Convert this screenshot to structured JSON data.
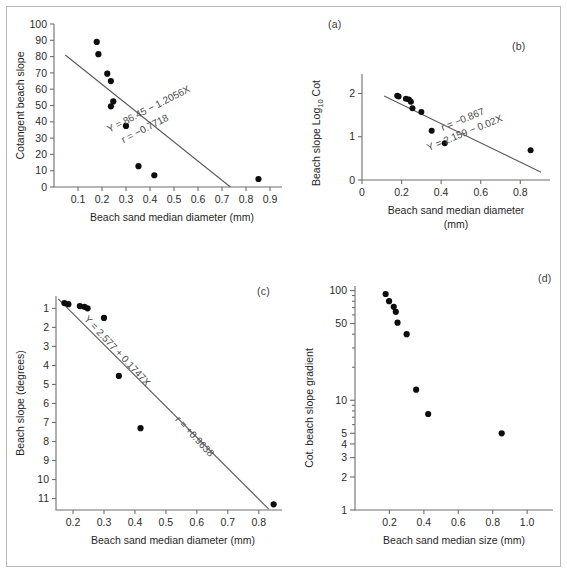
{
  "figure": {
    "background": "#ffffff",
    "border_color": "#b9b9b9",
    "point_color": "#0d0d0d",
    "line_color": "#5c5c5c"
  },
  "panels": {
    "a": {
      "label": "(a)"
    },
    "b": {
      "label": "(b)"
    },
    "c": {
      "label": "(c)"
    },
    "d": {
      "label": "(d)"
    }
  },
  "chart_data": [
    {
      "id": "a",
      "type": "scatter",
      "panel_label": "(a)",
      "title": "",
      "xlabel": "Beach sand median diameter (mm)",
      "ylabel": "Cotangent beach slope",
      "xlim": [
        0.0,
        0.95
      ],
      "ylim": [
        0,
        100
      ],
      "xticks": [
        0.1,
        0.2,
        0.3,
        0.4,
        0.5,
        0.6,
        0.7,
        0.8,
        0.9
      ],
      "xticklabels": [
        "0.1",
        "0.2",
        "0.3",
        "0.4",
        "0.5",
        "0.6",
        "0.7",
        "0.8",
        "0.9"
      ],
      "yticks": [
        0,
        10,
        20,
        30,
        40,
        50,
        60,
        70,
        80,
        90,
        100
      ],
      "yticklabels": [
        "0",
        "10",
        "20",
        "30",
        "40",
        "50",
        "60",
        "70",
        "80",
        "90",
        "100"
      ],
      "grid": false,
      "legend": "none",
      "x": [
        0.178,
        0.185,
        0.222,
        0.237,
        0.237,
        0.247,
        0.3,
        0.352,
        0.418,
        0.852
      ],
      "y": [
        89.0,
        81.5,
        69.5,
        65.0,
        49.5,
        52.5,
        37.5,
        12.8,
        7.2,
        4.9
      ],
      "fit": {
        "x0": 0.047,
        "y0": 81.0,
        "x1": 0.735,
        "y1": 0.0
      },
      "annotations": [
        {
          "text": "Y = 86.45 − 1.2056X",
          "x": 0.4,
          "y": 46.0,
          "rotate": -27
        },
        {
          "text": "r = −0.7718",
          "x": 0.385,
          "y": 34.0,
          "rotate": -27
        }
      ]
    },
    {
      "id": "b",
      "type": "scatter",
      "panel_label": "(b)",
      "title": "",
      "xlabel": "Beach sand median diameter (mm)",
      "xlabel_units": "(mm)",
      "ylabel": "Beach slope Log10 Cot",
      "ylabel_main": "Beach slope  Log",
      "ylabel_sub": "10",
      "ylabel_tail": " Cot",
      "xlim": [
        0.0,
        0.95
      ],
      "ylim": [
        0,
        2.45
      ],
      "xticks": [
        0.0,
        0.2,
        0.4,
        0.6,
        0.8
      ],
      "xticklabels": [
        "0",
        "0.2",
        "0.4",
        "0.6",
        "0.8"
      ],
      "yticks": [
        0,
        1,
        2
      ],
      "yticklabels": [
        "0",
        "1",
        "2"
      ],
      "grid": false,
      "legend": "none",
      "x": [
        0.178,
        0.185,
        0.222,
        0.237,
        0.247,
        0.255,
        0.3,
        0.352,
        0.418,
        0.852
      ],
      "y": [
        1.95,
        1.93,
        1.88,
        1.86,
        1.81,
        1.66,
        1.57,
        1.14,
        0.85,
        0.69
      ],
      "fit": {
        "x0": 0.112,
        "y0": 1.94,
        "x1": 0.905,
        "y1": 0.18
      },
      "annotations": [
        {
          "text": "r = −0.867",
          "x": 0.515,
          "y": 1.33,
          "rotate": -22
        },
        {
          "text": "Y = 2.159 − 0.02X",
          "x": 0.525,
          "y": 1.02,
          "rotate": -22
        }
      ]
    },
    {
      "id": "c",
      "type": "scatter",
      "panel_label": "(c)",
      "title": "",
      "xlabel": "Beach sand median diameter (mm)",
      "ylabel": "Beach slope (degrees)",
      "xlim": [
        0.145,
        0.875
      ],
      "ylim": [
        0.35,
        11.6
      ],
      "y_inverted": true,
      "xticks": [
        0.2,
        0.3,
        0.4,
        0.5,
        0.6,
        0.7,
        0.8
      ],
      "xticklabels": [
        "0.2",
        "0.3",
        "0.4",
        "0.5",
        "0.6",
        "0.7",
        "0.8"
      ],
      "yticks": [
        1,
        2,
        3,
        4,
        5,
        6,
        7,
        8,
        9,
        10,
        11
      ],
      "yticklabels": [
        "1",
        "2",
        "3",
        "4",
        "5",
        "6",
        "7",
        "8",
        "9",
        "10",
        "11"
      ],
      "grid": false,
      "legend": "none",
      "x": [
        0.172,
        0.185,
        0.222,
        0.237,
        0.247,
        0.3,
        0.348,
        0.418,
        0.848
      ],
      "y": [
        0.72,
        0.78,
        0.88,
        0.92,
        1.0,
        1.5,
        4.55,
        7.3,
        11.3
      ],
      "fit": {
        "x0": 0.152,
        "y0": 0.5,
        "x1": 0.832,
        "y1": 11.55
      },
      "annotations": [
        {
          "text": "Y = 2.577 + 0.1747X",
          "x": 0.335,
          "y": 3.35,
          "rotate": 47
        },
        {
          "text": "r = +0.9638",
          "x": 0.585,
          "y": 7.85,
          "rotate": 47
        }
      ]
    },
    {
      "id": "d",
      "type": "scatter",
      "panel_label": "(d)",
      "title": "",
      "xlabel": "Beach sand median size (mm)",
      "ylabel": "Cot. beach slope gradient",
      "xlim": [
        0.0,
        1.15
      ],
      "ylim": [
        1,
        110
      ],
      "yscale": "log",
      "xticks": [
        0.2,
        0.4,
        0.6,
        0.8,
        1.0
      ],
      "xticklabels": [
        "0.2",
        "0.4",
        "0.6",
        "0.8",
        "1.0"
      ],
      "yticks": [
        1,
        2,
        3,
        4,
        5,
        10,
        50,
        100
      ],
      "yticklabels": [
        "1",
        "2",
        "3",
        "4",
        "5",
        "10",
        "50",
        "100"
      ],
      "yminorticks": [
        6,
        7,
        8,
        9,
        20,
        30,
        40,
        60,
        70,
        80,
        90
      ],
      "grid": false,
      "legend": "none",
      "x": [
        0.178,
        0.198,
        0.225,
        0.237,
        0.247,
        0.3,
        0.355,
        0.425,
        0.852
      ],
      "y": [
        93.0,
        80.0,
        71.0,
        64.0,
        51.0,
        40.0,
        12.5,
        7.5,
        5.0
      ]
    }
  ]
}
